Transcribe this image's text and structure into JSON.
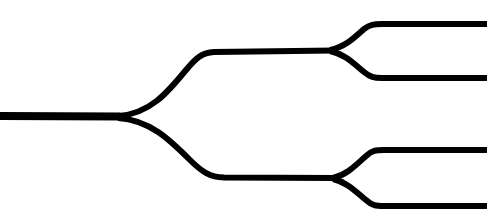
{
  "canvas": {
    "width": 499,
    "height": 223,
    "background_color": "#ffffff",
    "stroke_color": "#000000",
    "title": "Binary branching tree diagram"
  },
  "diagram": {
    "type": "binary-bifurcation-tree",
    "orientation": "left-to-right",
    "levels": 3,
    "split_count": 3,
    "terminal_count": 4,
    "trunk": {
      "label": "trunk",
      "start_x": 0,
      "end_x": 118,
      "y": 116,
      "stroke_width": 8
    },
    "nodes": [
      {
        "id": "split-1",
        "label": "primary-split",
        "x": 118,
        "y": 117
      },
      {
        "id": "split-2a",
        "label": "upper-secondary-split",
        "x": 332,
        "y": 50
      },
      {
        "id": "split-2b",
        "label": "lower-secondary-split",
        "x": 334,
        "y": 178
      }
    ],
    "branches": [
      {
        "id": "branch-upper",
        "label": "upper-primary-branch",
        "from": "split-1",
        "to": "split-2a",
        "level_y": 52,
        "stroke_width": 6
      },
      {
        "id": "branch-lower",
        "label": "lower-primary-branch",
        "from": "split-1",
        "to": "split-2b",
        "level_y": 177,
        "stroke_width": 6
      }
    ],
    "terminals": [
      {
        "id": "terminal-1",
        "label": "output-top",
        "from": "split-2a",
        "level_y": 24,
        "end_x": 487,
        "stroke_width": 6
      },
      {
        "id": "terminal-2",
        "label": "output-upper-middle",
        "from": "split-2a",
        "level_y": 78,
        "end_x": 487,
        "stroke_width": 6
      },
      {
        "id": "terminal-3",
        "label": "output-lower-middle",
        "from": "split-2b",
        "level_y": 150,
        "end_x": 487,
        "stroke_width": 6
      },
      {
        "id": "terminal-4",
        "label": "output-bottom",
        "from": "split-2b",
        "level_y": 206,
        "end_x": 487,
        "stroke_width": 6
      }
    ],
    "paths": {
      "trunk": "M 0,116 L 120,116.5",
      "branch_upper": "M 118,116 C 150,114 168,92 186,70 C 196,58 202,52.5 214,52 L 334,50.5",
      "branch_lower": "M 118,118 C 150,120 170,140 190,160 C 202,172 210,177 224,177.5 L 336,178",
      "terminal_top": "M 330,50 C 344,47 352,40 364,29 C 370,24.5 374,24 382,24 L 487,24",
      "terminal_upper_middle": "M 330,51 C 344,54 352,62 364,72 C 370,77 374,78 382,78 L 487,78",
      "terminal_lower_middle": "M 333,178 C 346,175 354,167 366,156 C 372,150.5 376,150 384,150 L 487,150",
      "terminal_bottom": "M 333,179 C 346,182 354,190 366,200 C 372,205.5 376,206 384,206 L 487,206"
    }
  }
}
